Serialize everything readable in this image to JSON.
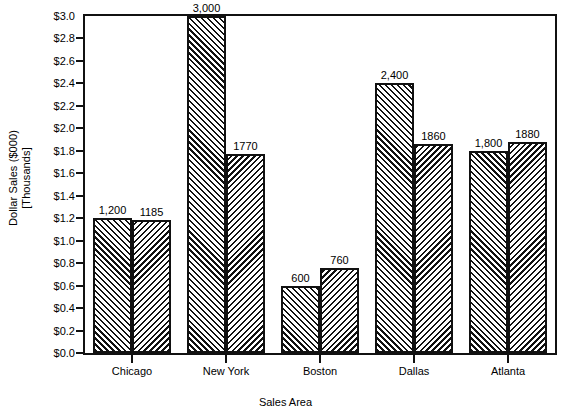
{
  "chart_data": {
    "type": "bar",
    "title": "",
    "xlabel": "Sales Area",
    "ylabel_line1": "Dollar Sales ($000)",
    "ylabel_line2": "[Thousands]",
    "categories": [
      "Chicago",
      "New York",
      "Boston",
      "Dallas",
      "Atlanta"
    ],
    "series": [
      {
        "name": "series-1",
        "hatch": "forward-slash",
        "values": [
          1200,
          3000,
          600,
          2400,
          1800
        ],
        "labels": [
          "1,200",
          "3,000",
          "600",
          "2,400",
          "1,800"
        ]
      },
      {
        "name": "series-2",
        "hatch": "back-slash",
        "values": [
          1185,
          1770,
          760,
          1860,
          1880
        ],
        "labels": [
          "1185",
          "1770",
          "760",
          "1860",
          "1880"
        ]
      }
    ],
    "ylim": [
      0,
      3000
    ],
    "ytick_values": [
      0,
      200,
      400,
      600,
      800,
      1000,
      1200,
      1400,
      1600,
      1800,
      2000,
      2200,
      2400,
      2600,
      2800,
      3000
    ],
    "ytick_labels": [
      "$0.0",
      "$0.2",
      "$0.4",
      "$0.6",
      "$0.8",
      "$1.0",
      "$1.2",
      "$1.4",
      "$1.6",
      "$1.8",
      "$2.0",
      "$2.2",
      "$2.4",
      "$2.6",
      "$2.8",
      "$3.0"
    ],
    "grid": false,
    "legend": "none",
    "colors": {
      "line": "#111111",
      "background": "#ffffff",
      "hatch": "#111111"
    }
  }
}
